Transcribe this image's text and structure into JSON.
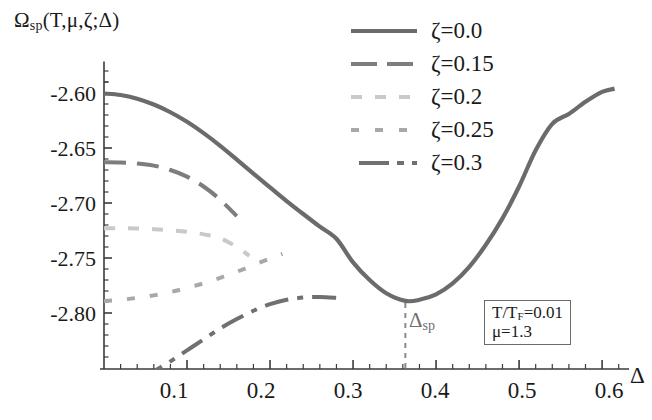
{
  "figure": {
    "y_axis_label": "Ω",
    "y_axis_label_sub": "sp",
    "y_axis_label_args": "(T,μ,ζ;Δ)",
    "x_axis_label": "Δ"
  },
  "axes": {
    "y_ticks": [
      "-2.60",
      "-2.65",
      "-2.70",
      "-2.75",
      "-2.80"
    ],
    "x_ticks": [
      "0.1",
      "0.2",
      "0.3",
      "0.4",
      "0.5",
      "0.6"
    ]
  },
  "legend": {
    "entries": [
      {
        "label": "ζ=0.0",
        "style": "solid",
        "color": "#6b6b6b"
      },
      {
        "label": "ζ=0.15",
        "style": "longdash",
        "color": "#7d7d7d"
      },
      {
        "label": "ζ=0.2",
        "style": "dotdash",
        "color": "#c9c9c9"
      },
      {
        "label": "ζ=0.25",
        "style": "shortdash",
        "color": "#a8a8a8"
      },
      {
        "label": "ζ=0.3",
        "style": "dashdot",
        "color": "#707070"
      }
    ]
  },
  "annotations": {
    "param_line1": "T/T",
    "param_line1_sub": "F",
    "param_line1_val": "=0.01",
    "param_line2": "μ=1.3",
    "delta_sp": "Δ",
    "delta_sp_sub": "sp"
  },
  "chart_data": {
    "type": "line",
    "title": "",
    "xlabel": "Δ",
    "ylabel": "Ω_sp(T,μ,ζ;Δ)",
    "xlim": [
      0.0,
      0.63
    ],
    "ylim": [
      -2.845,
      -2.575
    ],
    "xticks": [
      0.1,
      0.2,
      0.3,
      0.4,
      0.5,
      0.6
    ],
    "yticks": [
      -2.6,
      -2.65,
      -2.7,
      -2.75,
      -2.8
    ],
    "grid": false,
    "legend_position": "top-right",
    "minimum_marker": {
      "x": 0.363,
      "label": "Δ_sp",
      "y": -2.789
    },
    "series": [
      {
        "name": "ζ=0.0",
        "style": "solid",
        "color": "#6b6b6b",
        "x": [
          0.0,
          0.02,
          0.04,
          0.06,
          0.08,
          0.1,
          0.12,
          0.14,
          0.16,
          0.18,
          0.2,
          0.22,
          0.24,
          0.26,
          0.28,
          0.3,
          0.32,
          0.34,
          0.363,
          0.38,
          0.4,
          0.42,
          0.44,
          0.46,
          0.48,
          0.5,
          0.52,
          0.54,
          0.56,
          0.58,
          0.6,
          0.615
        ],
        "y": [
          -2.6005,
          -2.6018,
          -2.6052,
          -2.6105,
          -2.6175,
          -2.6262,
          -2.6365,
          -2.648,
          -2.6605,
          -2.6733,
          -2.6858,
          -2.6982,
          -2.71,
          -2.7215,
          -2.7325,
          -2.754,
          -2.77,
          -2.782,
          -2.789,
          -2.788,
          -2.783,
          -2.773,
          -2.758,
          -2.738,
          -2.714,
          -2.685,
          -2.652,
          -2.628,
          -2.619,
          -2.608,
          -2.599,
          -2.596
        ]
      },
      {
        "name": "ζ=0.15",
        "style": "longdash",
        "color": "#7d7d7d",
        "x": [
          0.0,
          0.02,
          0.04,
          0.06,
          0.08,
          0.1,
          0.12,
          0.14,
          0.16
        ],
        "y": [
          -2.663,
          -2.6632,
          -2.664,
          -2.666,
          -2.67,
          -2.676,
          -2.685,
          -2.697,
          -2.712
        ]
      },
      {
        "name": "ζ=0.2",
        "style": "dotdash",
        "color": "#c9c9c9",
        "x": [
          0.0,
          0.02,
          0.04,
          0.06,
          0.08,
          0.1,
          0.12,
          0.14,
          0.16,
          0.175
        ],
        "y": [
          -2.723,
          -2.723,
          -2.7232,
          -2.7238,
          -2.7248,
          -2.7262,
          -2.7285,
          -2.732,
          -2.74,
          -2.748
        ]
      },
      {
        "name": "ζ=0.25",
        "style": "shortdash",
        "color": "#a8a8a8",
        "x": [
          0.0,
          0.02,
          0.04,
          0.06,
          0.08,
          0.1,
          0.12,
          0.14,
          0.16,
          0.18,
          0.2,
          0.215
        ],
        "y": [
          -2.789,
          -2.788,
          -2.7862,
          -2.784,
          -2.781,
          -2.7772,
          -2.773,
          -2.768,
          -2.7625,
          -2.7565,
          -2.7505,
          -2.7462
        ]
      },
      {
        "name": "ζ=0.3",
        "style": "dashdot",
        "color": "#707070",
        "x": [
          0.045,
          0.06,
          0.08,
          0.1,
          0.12,
          0.14,
          0.16,
          0.18,
          0.2,
          0.22,
          0.24,
          0.26,
          0.28,
          0.29
        ],
        "y": [
          -2.86,
          -2.853,
          -2.844,
          -2.834,
          -2.824,
          -2.814,
          -2.8055,
          -2.798,
          -2.792,
          -2.788,
          -2.786,
          -2.7855,
          -2.7862,
          -2.7868
        ]
      }
    ]
  }
}
